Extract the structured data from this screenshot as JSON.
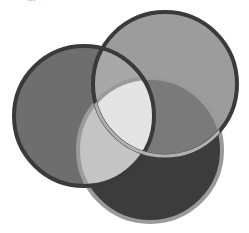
{
  "caption": {
    "text": "..."
  },
  "diagram": {
    "type": "venn",
    "sets": 3,
    "circles": [
      {
        "name": "left",
        "cx": 84,
        "cy": 116,
        "r": 70,
        "fill": "#6e6e6e",
        "stroke": "#3a3a3a"
      },
      {
        "name": "top-right",
        "cx": 165,
        "cy": 84,
        "r": 72,
        "fill": "#9c9c9c",
        "stroke": "#3a3a3a"
      },
      {
        "name": "bottom",
        "cx": 150,
        "cy": 150,
        "r": 72,
        "fill": "#3c3c3c",
        "stroke": "#9a9a9a"
      }
    ],
    "regions": {
      "left_top": "#a8a8a8",
      "left_bottom": "#c4c4c4",
      "top_bottom": "#7a7a7a",
      "center": "#e4e4e4"
    }
  }
}
